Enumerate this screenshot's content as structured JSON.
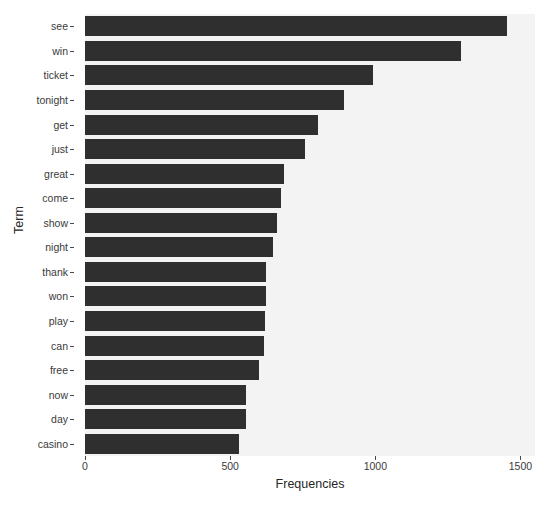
{
  "chart_data": {
    "type": "bar",
    "orientation": "horizontal",
    "title": "",
    "xlabel": "Frequencies",
    "ylabel": "Term",
    "categories": [
      "see",
      "win",
      "ticket",
      "tonight",
      "get",
      "just",
      "great",
      "come",
      "show",
      "night",
      "thank",
      "won",
      "play",
      "can",
      "free",
      "now",
      "day",
      "casino"
    ],
    "values": [
      1452,
      1294,
      992,
      892,
      803,
      759,
      687,
      676,
      663,
      646,
      625,
      622,
      620,
      618,
      601,
      556,
      553,
      529
    ],
    "xlim": [
      0,
      1550
    ],
    "xticks": [
      0,
      500,
      1000,
      1500
    ],
    "xtick_labels": [
      "0",
      "500",
      "1000",
      "1500"
    ],
    "grid": false,
    "legend": false,
    "bar_color": "#2f2f2f",
    "panel_background": "#f3f3f3",
    "figure_background": "#ffffff"
  }
}
